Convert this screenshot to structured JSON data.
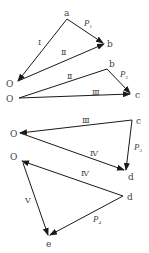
{
  "diagram": {
    "type": "force-polygon-decomposition",
    "colors": {
      "line": "#1a1a1a",
      "text": "#444444",
      "background": "#ffffff"
    },
    "triangles": [
      {
        "points": {
          "O": "O",
          "a": "a",
          "b": "b"
        },
        "edges": [
          {
            "from": "O",
            "to": "a",
            "label": "Ⅰ",
            "arrow": false
          },
          {
            "from": "a",
            "to": "b",
            "label": "P",
            "sub": "1",
            "arrow": true
          },
          {
            "from": "O",
            "to": "b",
            "label": "Ⅱ",
            "arrow": true
          },
          {
            "from": "a",
            "to": "O",
            "arrow": true
          }
        ]
      },
      {
        "points": {
          "O": "O",
          "b": "b",
          "c": "c"
        },
        "edges": [
          {
            "from": "O",
            "to": "b",
            "label": "Ⅱ"
          },
          {
            "from": "b",
            "to": "c",
            "label": "P",
            "sub": "2",
            "arrow": true
          },
          {
            "from": "O",
            "to": "c",
            "label": "Ⅲ",
            "arrow": true
          }
        ]
      },
      {
        "points": {
          "O": "O",
          "c": "c",
          "d": "d"
        },
        "edges": [
          {
            "from": "c",
            "to": "O",
            "label": "Ⅲ",
            "arrow": true
          },
          {
            "from": "c",
            "to": "d",
            "label": "P",
            "sub": "3",
            "arrow": true
          },
          {
            "from": "O",
            "to": "d",
            "label": "Ⅳ",
            "arrow": true
          }
        ]
      },
      {
        "points": {
          "O": "O",
          "d": "d",
          "e": "e"
        },
        "edges": [
          {
            "from": "d",
            "to": "O",
            "label": "Ⅳ",
            "arrow": true
          },
          {
            "from": "d",
            "to": "e",
            "label": "P",
            "sub": "4",
            "arrow": true
          },
          {
            "from": "O",
            "to": "e",
            "label": "Ⅴ",
            "arrow": true
          }
        ]
      }
    ],
    "labels": {
      "t1": {
        "a": "a",
        "b": "b",
        "O": "O",
        "I": "Ⅰ",
        "II": "Ⅱ",
        "P": "P",
        "Psub": "1"
      },
      "t2": {
        "b": "b",
        "c": "c",
        "O": "O",
        "II": "Ⅱ",
        "III": "Ⅲ",
        "P": "P",
        "Psub": "2"
      },
      "t3": {
        "c": "c",
        "d": "d",
        "O": "O",
        "III": "Ⅲ",
        "IV": "Ⅳ",
        "P": "P",
        "Psub": "3"
      },
      "t4": {
        "d": "d",
        "e": "e",
        "O": "O",
        "IV": "Ⅳ",
        "V": "Ⅴ",
        "P": "P",
        "Psub": "4"
      }
    }
  }
}
